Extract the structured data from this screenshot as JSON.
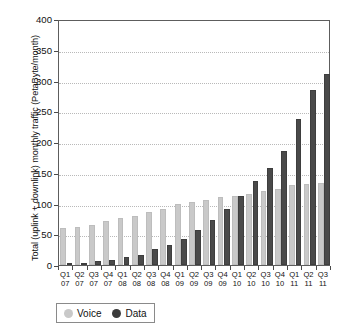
{
  "chart_data": {
    "type": "bar",
    "title": "",
    "xlabel": "",
    "ylabel": "Total (uplink + downlink) monthly traffic (PetaByte/month)",
    "ylim": [
      0,
      400
    ],
    "ytick_values": [
      0,
      50,
      100,
      150,
      200,
      250,
      300,
      350,
      400
    ],
    "ytick_labels": [
      "0",
      "50",
      "100",
      "150",
      "200",
      "250",
      "300",
      "350",
      "400"
    ],
    "grid": true,
    "legend_position": "bottom-left",
    "categories": [
      "Q1 07",
      "Q2 07",
      "Q3 07",
      "Q4 07",
      "Q1 08",
      "Q2 08",
      "Q3 08",
      "Q4 08",
      "Q1 09",
      "Q2 09",
      "Q3 09",
      "Q4 09",
      "Q1 10",
      "Q2 10",
      "Q3 10",
      "Q4 10",
      "Q1 11",
      "Q2 11",
      "Q3 11"
    ],
    "category_lines": [
      {
        "quarter": "Q1",
        "year": "07"
      },
      {
        "quarter": "Q2",
        "year": "07"
      },
      {
        "quarter": "Q3",
        "year": "07"
      },
      {
        "quarter": "Q4",
        "year": "07"
      },
      {
        "quarter": "Q1",
        "year": "08"
      },
      {
        "quarter": "Q2",
        "year": "08"
      },
      {
        "quarter": "Q3",
        "year": "08"
      },
      {
        "quarter": "Q4",
        "year": "08"
      },
      {
        "quarter": "Q1",
        "year": "09"
      },
      {
        "quarter": "Q2",
        "year": "09"
      },
      {
        "quarter": "Q3",
        "year": "09"
      },
      {
        "quarter": "Q4",
        "year": "09"
      },
      {
        "quarter": "Q1",
        "year": "10"
      },
      {
        "quarter": "Q2",
        "year": "10"
      },
      {
        "quarter": "Q3",
        "year": "10"
      },
      {
        "quarter": "Q4",
        "year": "10"
      },
      {
        "quarter": "Q1",
        "year": "11"
      },
      {
        "quarter": "Q2",
        "year": "11"
      },
      {
        "quarter": "Q3",
        "year": "11"
      }
    ],
    "series": [
      {
        "name": "Voice",
        "color": "#c9c9c9",
        "values": [
          60,
          62,
          65,
          71,
          77,
          80,
          86,
          91,
          100,
          103,
          106,
          110,
          113,
          116,
          120,
          123,
          130,
          132,
          133
        ]
      },
      {
        "name": "Data",
        "color": "#4a4a4a",
        "values": [
          3,
          4,
          6,
          8,
          13,
          17,
          26,
          32,
          42,
          57,
          73,
          91,
          112,
          136,
          158,
          186,
          238,
          285,
          310
        ]
      }
    ]
  },
  "legend": {
    "voice_label": "Voice",
    "data_label": "Data"
  }
}
